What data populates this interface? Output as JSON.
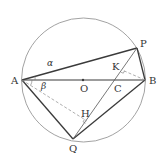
{
  "figure": {
    "type": "geometry-circle-diagram",
    "colors": {
      "circle": "#8a8a8a",
      "thick_line": "#3a3a3a",
      "thin_line": "#555555",
      "dashed_line": "#9a9a9a",
      "text": "#333333"
    },
    "circle": {
      "cx": 83.5,
      "cy": 80,
      "r": 62
    },
    "points": {
      "A": {
        "label": "A",
        "x": 22,
        "y": 80
      },
      "B": {
        "label": "B",
        "x": 145,
        "y": 80
      },
      "O": {
        "label": "O",
        "x": 83,
        "y": 80
      },
      "P": {
        "label": "P",
        "x": 137,
        "y": 48
      },
      "Q": {
        "label": "Q",
        "x": 73,
        "y": 139
      },
      "C": {
        "label": "C",
        "x": 115,
        "y": 80
      },
      "K": {
        "label": "K",
        "x": 122,
        "y": 70
      },
      "H": {
        "label": "H",
        "x": 87,
        "y": 121
      }
    },
    "angles": {
      "alpha": {
        "label": "α"
      },
      "beta": {
        "label": "β"
      }
    }
  }
}
